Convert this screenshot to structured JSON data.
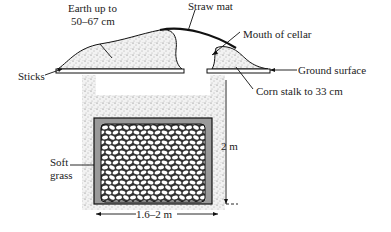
{
  "diagram": {
    "type": "cross-section",
    "labels": {
      "straw_mat": "Straw mat",
      "earth_line1": "Earth up to",
      "earth_line2": "50–67 cm",
      "mouth": "Mouth of cellar",
      "sticks": "Sticks",
      "ground": "Ground surface",
      "corn": "Corn stalk to 33 cm",
      "soft_line1": "Soft",
      "soft_line2": "grass",
      "height": "2 m",
      "width": "1.6–2 m"
    },
    "colors": {
      "ink": "#1a1a1a",
      "soil": "#e6e6e6",
      "grass": "#9a9a9a",
      "background": "#ffffff"
    }
  }
}
